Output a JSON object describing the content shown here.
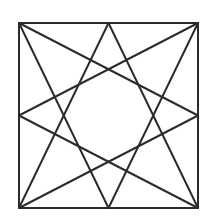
{
  "diagram": {
    "type": "geometric-figure",
    "stroke_color": "#2b2b2b",
    "background_color": "#ffffff",
    "square": {
      "x": 19,
      "y": 23,
      "width": 179,
      "height": 185
    },
    "vertices": {
      "top_left": [
        19,
        23
      ],
      "top_right": [
        198,
        23
      ],
      "bottom_left": [
        19,
        208
      ],
      "bottom_right": [
        198,
        208
      ],
      "top_mid": [
        108.5,
        23
      ],
      "bottom_mid": [
        108.5,
        208
      ],
      "left_mid": [
        19,
        115.5
      ],
      "right_mid": [
        198,
        115.5
      ]
    },
    "lines": [
      {
        "from": "top_left",
        "to": "right_mid"
      },
      {
        "from": "top_left",
        "to": "bottom_mid"
      },
      {
        "from": "top_right",
        "to": "left_mid"
      },
      {
        "from": "top_right",
        "to": "bottom_mid"
      },
      {
        "from": "bottom_left",
        "to": "top_mid"
      },
      {
        "from": "bottom_left",
        "to": "right_mid"
      },
      {
        "from": "bottom_right",
        "to": "top_mid"
      },
      {
        "from": "bottom_right",
        "to": "left_mid"
      }
    ]
  }
}
